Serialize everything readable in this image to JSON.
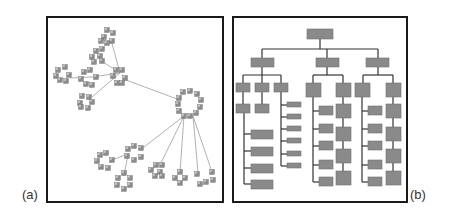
{
  "figure": {
    "panel_a": {
      "label": "(a)",
      "description": "Force-directed network layout of clustered nodes",
      "colors": {
        "node": "#8c8c8c",
        "node_highlight": "#b5b5b5",
        "edge": "#a8a8a8"
      }
    },
    "panel_b": {
      "label": "(b)",
      "description": "Hierarchical tree layout (organization chart)",
      "colors": {
        "box": "#8a8a8a",
        "box_border": "#6e6e6e",
        "line": "#333333"
      }
    },
    "frame_color": "#1a1a1a"
  }
}
